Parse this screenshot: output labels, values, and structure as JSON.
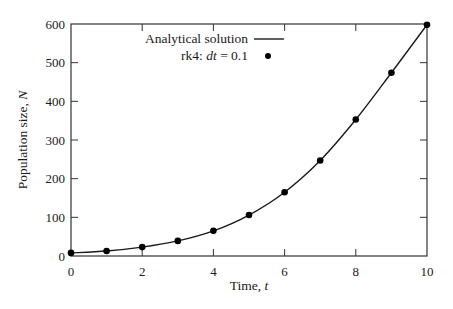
{
  "chart_data": {
    "type": "line",
    "title": "",
    "xlabel": "Time, t",
    "xlabel_prefix": "Time, ",
    "xlabel_var": "t",
    "ylabel": "Population size, N",
    "ylabel_prefix": "Population size, ",
    "ylabel_var": "N",
    "xlim": [
      0,
      10
    ],
    "ylim": [
      0,
      600
    ],
    "xticks": [
      0,
      2,
      4,
      6,
      8,
      10
    ],
    "yticks": [
      0,
      100,
      200,
      300,
      400,
      500,
      600
    ],
    "grid": false,
    "legend_position": "upper left",
    "series": [
      {
        "name": "Analytical solution",
        "style": "solid line",
        "x": [
          0,
          1,
          2,
          3,
          4,
          5,
          6,
          7,
          8,
          9,
          10
        ],
        "values": [
          8,
          13,
          23,
          39,
          65,
          106,
          165,
          247,
          353,
          474,
          598
        ]
      },
      {
        "name": "rk4: dt = 0.1",
        "style": "markers",
        "x": [
          0,
          1,
          2,
          3,
          4,
          5,
          6,
          7,
          8,
          9,
          10
        ],
        "values": [
          8,
          13,
          23,
          39,
          65,
          106,
          165,
          247,
          353,
          474,
          598
        ]
      }
    ]
  },
  "legend": {
    "analytical_label": "Analytical solution",
    "rk4_prefix": "rk4: ",
    "rk4_var": "dt",
    "rk4_suffix": " = 0.1"
  },
  "colors": {
    "line": "#1a1a1a",
    "marker": "#000000",
    "axes": "#333333"
  }
}
